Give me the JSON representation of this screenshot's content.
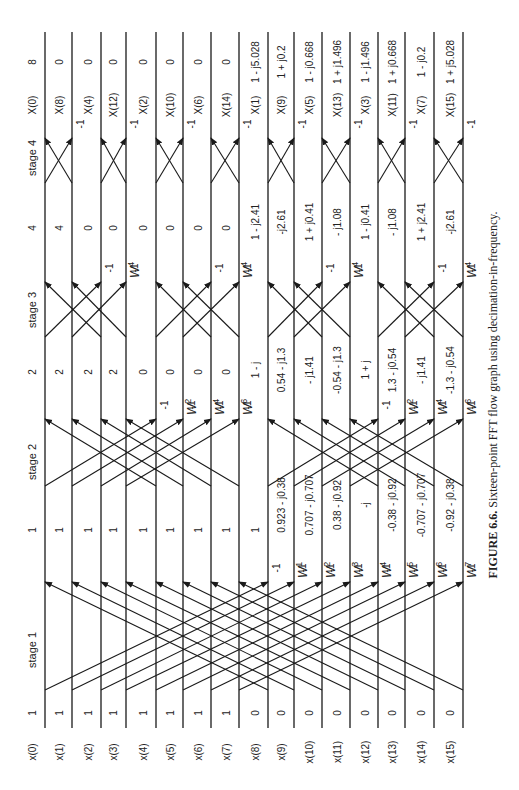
{
  "figure": {
    "caption_label": "FIGURE 6.6.",
    "caption_text": "Sixteen-point FFT flow graph using decimation-in-frequency.",
    "stage_labels": [
      "stage 1",
      "stage 2",
      "stage 3",
      "stage 4"
    ],
    "inputs": [
      "x(0)",
      "x(1)",
      "x(2)",
      "x(3)",
      "x(4)",
      "x(5)",
      "x(6)",
      "x(7)",
      "x(8)",
      "x(9)",
      "x(10)",
      "x(11)",
      "x(12)",
      "x(13)",
      "x(14)",
      "x(15)"
    ],
    "input_values": [
      "1",
      "1",
      "1",
      "1",
      "1",
      "1",
      "1",
      "1",
      "0",
      "0",
      "0",
      "0",
      "0",
      "0",
      "0",
      "0"
    ],
    "stage1_values": [
      "1",
      "1",
      "1",
      "1",
      "1",
      "1",
      "1",
      "1",
      "1",
      "0.923 - j0.38",
      "0.707 - j0.707",
      "0.38 - j0.92",
      "-j",
      "-0.38 - j0.92",
      "-0.707 - j0.707",
      "-0.92 - j0.38"
    ],
    "stage2_values": [
      "2",
      "2",
      "2",
      "2",
      "0",
      "0",
      "0",
      "0",
      "1 - j",
      "0.54 - j1.3",
      "- j1.41",
      "-0.54 - j1.3",
      "1 + j",
      "1.3 - j0.54",
      "- j1.41",
      "-1.3 - j0.54"
    ],
    "stage3_values": [
      "4",
      "4",
      "0",
      "0",
      "0",
      "0",
      "0",
      "0",
      "1 - j2.41",
      "-j2.61",
      "1 + j0.41",
      "- j1.08",
      "1 - j0.41",
      "- j1.08",
      "1 + j2.41",
      "-j2.61"
    ],
    "outputs": [
      "X(0)",
      "X(8)",
      "X(4)",
      "X(12)",
      "X(2)",
      "X(10)",
      "X(6)",
      "X(14)",
      "X(1)",
      "X(9)",
      "X(5)",
      "X(13)",
      "X(3)",
      "X(11)",
      "X(7)",
      "X(15)"
    ],
    "output_values": [
      "8",
      "0",
      "0",
      "0",
      "0",
      "0",
      "0",
      "0",
      "1 - j5.028",
      "1 + j0.2",
      "1 - j0.668",
      "1 + j1.496",
      "1 - j1.496",
      "1 + j0.668",
      "1 - j0.2",
      "1 + j5.028"
    ],
    "minus_one": "-1",
    "stage1_twiddles": [
      "",
      "",
      "",
      "",
      "",
      "",
      "",
      "",
      "",
      "W1",
      "W2",
      "W3",
      "W4",
      "W5",
      "W6",
      "W7"
    ],
    "stage2_twiddles": [
      "",
      "",
      "",
      "",
      "",
      "W2",
      "W4",
      "W6",
      "",
      "",
      "",
      "",
      "",
      "W2",
      "W4",
      "W6"
    ],
    "stage3_twiddles": [
      "",
      "",
      "",
      "W4",
      "",
      "",
      "",
      "W4",
      "",
      "",
      "",
      "W4",
      "",
      "",
      "",
      "W4"
    ]
  }
}
